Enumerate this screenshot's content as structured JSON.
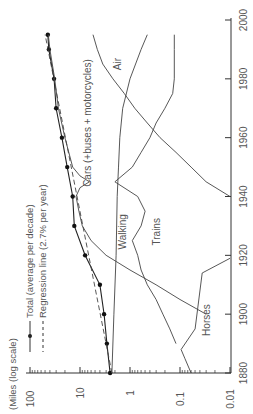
{
  "chart_data": {
    "type": "line",
    "orientation": "rotated-90-ccw",
    "title": "",
    "xlabel": "",
    "ylabel": "(Miles (log scale)",
    "yscale": "log",
    "xlim": [
      1880,
      2000
    ],
    "ylim": [
      0.01,
      100
    ],
    "x_ticks": [
      1880,
      1900,
      1920,
      1940,
      1960,
      1980,
      2000
    ],
    "y_ticks": [
      {
        "value": 100,
        "label": "100"
      },
      {
        "value": 10,
        "label": "10"
      },
      {
        "value": 1,
        "label": "1"
      },
      {
        "value": 0.1,
        "label": "0.1"
      },
      {
        "value": 0.01,
        "label": "0.01"
      }
    ],
    "grid": false,
    "legend": [
      {
        "label": "Total (average per decade)",
        "style": "solid-with-dots"
      },
      {
        "label": "Regression line (2.7% per year)",
        "style": "dashed"
      }
    ],
    "series": [
      {
        "name": "Total (average per decade)",
        "style": "solid-dots",
        "x": [
          1880,
          1890,
          1900,
          1910,
          1920,
          1930,
          1940,
          1950,
          1960,
          1970,
          1980,
          1990,
          1995
        ],
        "values": [
          2.5,
          2.9,
          3.3,
          4.0,
          7.9,
          13,
          14,
          18,
          23,
          30,
          33,
          42,
          44
        ]
      },
      {
        "name": "Regression line (2.7% per year)",
        "style": "dashed",
        "x": [
          1880,
          1995
        ],
        "values": [
          2.3,
          50
        ]
      },
      {
        "name": "Cars (+buses + motorcycles)",
        "style": "solid",
        "x": [
          1900,
          1905,
          1910,
          1915,
          1920,
          1925,
          1930,
          1935,
          1940,
          1943,
          1945,
          1947,
          1950,
          1960,
          1970,
          1980,
          1990,
          1995
        ],
        "values": [
          0.03,
          0.1,
          0.3,
          1.0,
          3.0,
          6.0,
          9.0,
          10.5,
          12,
          10,
          6.5,
          10,
          14,
          20,
          27,
          32,
          40,
          43
        ]
      },
      {
        "name": "Walking",
        "style": "solid",
        "x": [
          1880,
          1900,
          1920,
          1940,
          1950,
          1960,
          1970,
          1980,
          1990,
          1995
        ],
        "values": [
          2.3,
          2.1,
          1.9,
          1.8,
          1.7,
          1.6,
          1.4,
          1.0,
          0.6,
          0.45
        ]
      },
      {
        "name": "Trains",
        "style": "solid",
        "x": [
          1890,
          1895,
          1900,
          1905,
          1910,
          1915,
          1920,
          1925,
          1930,
          1935,
          1940,
          1945,
          1950,
          1955,
          1960,
          1965,
          1970,
          1975,
          1980,
          1990,
          1995
        ],
        "values": [
          0.12,
          0.16,
          0.22,
          0.3,
          0.45,
          0.6,
          0.7,
          0.9,
          0.6,
          0.5,
          0.7,
          2.0,
          0.9,
          0.6,
          0.4,
          0.3,
          0.2,
          0.14,
          0.13,
          0.13,
          0.13
        ]
      },
      {
        "name": "Air",
        "style": "solid",
        "x": [
          1940,
          1945,
          1950,
          1955,
          1960,
          1965,
          1970,
          1975,
          1980,
          1985,
          1990,
          1995
        ],
        "values": [
          0.01,
          0.03,
          0.06,
          0.12,
          0.25,
          0.45,
          0.8,
          1.3,
          2.2,
          3.5,
          4.5,
          5.5
        ]
      },
      {
        "name": "Horses",
        "style": "solid",
        "x": [
          1880,
          1885,
          1888,
          1895,
          1914,
          1919
        ],
        "values": [
          0.06,
          0.08,
          0.095,
          0.05,
          0.036,
          0.01
        ]
      }
    ],
    "annotations": [
      {
        "text": "Cars (+buses + motorcycles)",
        "year": 1965,
        "value": 6
      },
      {
        "text": "Air",
        "year": 1985,
        "value": 1.5
      },
      {
        "text": "Walking",
        "year": 1928,
        "value": 1.2
      },
      {
        "text": "Trains",
        "year": 1928,
        "value": 0.25
      },
      {
        "text": "Horses",
        "year": 1898,
        "value": 0.025
      }
    ]
  },
  "labels": {
    "axis_title": "(Miles (log scale)",
    "legend_total": "Total (average per decade)",
    "legend_regression": "Regression line (2.7% per year)",
    "cars": "Cars (+buses + motorcycles)",
    "air": "Air",
    "walking": "Walking",
    "trains": "Trains",
    "horses": "Horses"
  }
}
